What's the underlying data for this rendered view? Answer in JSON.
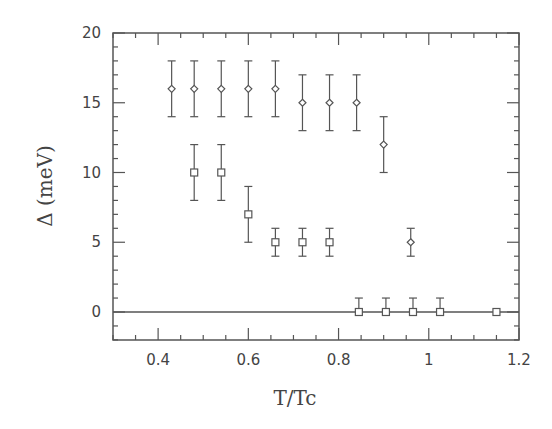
{
  "chart_data": {
    "type": "scatter",
    "title": "",
    "xlabel": "T/Tc",
    "ylabel": "Δ (meV)",
    "xlim": [
      0.3,
      1.2
    ],
    "ylim": [
      -2,
      20
    ],
    "grid": false,
    "legend": null,
    "x_ticks": [
      0.4,
      0.6,
      0.8,
      1,
      1.2
    ],
    "x_tick_labels": [
      "0.4",
      "0.6",
      "0.8",
      "1",
      "1.2"
    ],
    "y_ticks": [
      0,
      5,
      10,
      15,
      20
    ],
    "y_tick_labels": [
      "0",
      "5",
      "10",
      "15",
      "20"
    ],
    "reference_line": {
      "y": 0
    },
    "series": [
      {
        "name": "diamonds",
        "marker": "diamond",
        "x": [
          0.43,
          0.48,
          0.54,
          0.6,
          0.66,
          0.72,
          0.78,
          0.84,
          0.9,
          0.96
        ],
        "y": [
          16,
          16,
          16,
          16,
          16,
          15,
          15,
          15,
          12,
          5
        ],
        "err": [
          2,
          2,
          2,
          2,
          2,
          2,
          2,
          2,
          2,
          1
        ]
      },
      {
        "name": "squares",
        "marker": "square",
        "x": [
          0.48,
          0.54,
          0.6,
          0.66,
          0.72,
          0.78,
          0.845,
          0.905,
          0.965,
          1.025,
          1.15
        ],
        "y": [
          10,
          10,
          7,
          5,
          5,
          5,
          0,
          0,
          0,
          0,
          0
        ],
        "err_up": [
          2,
          2,
          2,
          1,
          1,
          1,
          1,
          1,
          1,
          1,
          0
        ],
        "err_down": [
          2,
          2,
          2,
          1,
          1,
          1,
          0,
          0,
          0,
          0,
          0
        ]
      }
    ]
  }
}
